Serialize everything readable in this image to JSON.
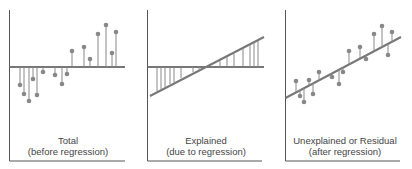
{
  "panels": [
    {
      "id": "total",
      "caption_line1": "Total",
      "caption_line2": "(before regression)"
    },
    {
      "id": "explained",
      "caption_line1": "Explained",
      "caption_line2": "(due to regression)"
    },
    {
      "id": "residual",
      "caption_line1": "Unexplained or Residual",
      "caption_line2": "(after regression)"
    }
  ],
  "colors": {
    "axis": "#555555",
    "line": "#777777",
    "point": "#888888",
    "text": "#444444"
  }
}
